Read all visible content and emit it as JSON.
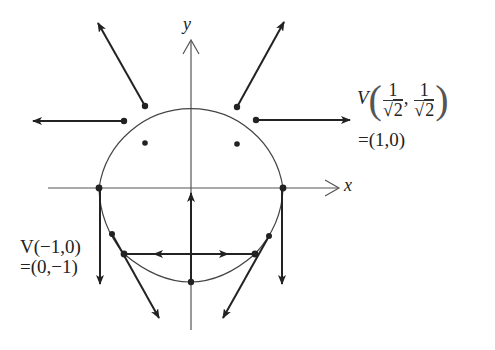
{
  "axes": {
    "x_label": "x",
    "y_label": "y"
  },
  "colors": {
    "stroke": "#222222",
    "axis": "#555555",
    "background": "#ffffff"
  },
  "labels": {
    "top_right": {
      "func": "V",
      "frac1_num": "1",
      "frac1_den": "2",
      "frac1_root": "√",
      "sep": ",",
      "frac2_num": "1",
      "frac2_den": "2",
      "frac2_root": "√",
      "open_paren": "(",
      "close_paren": ")",
      "result": "=(1,0)"
    },
    "left": {
      "line1": "V(−1,0)",
      "line2": "=(0,−1)"
    }
  },
  "geometry": {
    "circle": {
      "cx": 191,
      "cy": 188,
      "r": 93
    },
    "points": [
      {
        "name": "upper-left",
        "x": 145,
        "y": 106
      },
      {
        "name": "left-upper",
        "x": 124,
        "y": 121
      },
      {
        "name": "upper-right",
        "x": 237,
        "y": 107
      },
      {
        "name": "right-upper",
        "x": 256,
        "y": 120
      },
      {
        "name": "inner-left",
        "x": 145,
        "y": 143
      },
      {
        "name": "inner-right",
        "x": 237,
        "y": 144
      },
      {
        "name": "left-axis",
        "x": 99,
        "y": 188
      },
      {
        "name": "right-axis",
        "x": 283,
        "y": 188
      },
      {
        "name": "lower-left-small",
        "x": 112,
        "y": 234
      },
      {
        "name": "lower-right-small",
        "x": 269,
        "y": 236
      },
      {
        "name": "chord-left",
        "x": 124,
        "y": 254
      },
      {
        "name": "chord-right",
        "x": 255,
        "y": 254
      },
      {
        "name": "bottom",
        "x": 191,
        "y": 282
      }
    ]
  }
}
